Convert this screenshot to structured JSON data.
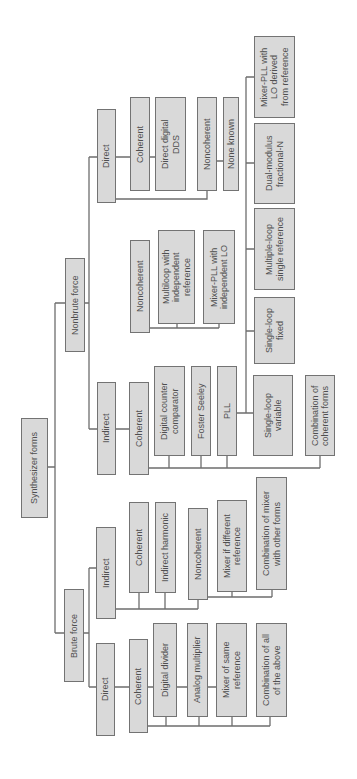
{
  "diagram": {
    "root": {
      "label": "Synthesizer forms"
    },
    "nonbrute_force": {
      "label": "Nonbrute force",
      "direct": {
        "label": "Direct",
        "coherent": {
          "label": "Coherent",
          "items": [
            "Direct digital\nDDS"
          ]
        },
        "noncoherent": {
          "label": "Noncoherent",
          "items": [
            "None known"
          ]
        }
      },
      "indirect": {
        "label": "Indirect",
        "noncoherent": {
          "label": "Noncoherent",
          "items": [
            "Multiloop with\nindependent\nreference",
            "Mixer-PLL with\nindependent LO"
          ]
        },
        "coherent": {
          "label": "Coherent",
          "items": [
            "Digital counter\ncomparator",
            "Foster Seeley",
            "PLL",
            "Combination of\ncoherent forms"
          ],
          "pll_types": [
            "Mixer-PLL with\nLO derived\nfrom reference",
            "Dual-modulus\nfractional-N",
            "Multiple-loop\nsingle reference",
            "Single-loop\nfixed",
            "Single-loop\nvariable"
          ]
        }
      }
    },
    "brute_force": {
      "label": "Brute force",
      "indirect": {
        "label": "Indirect",
        "coherent": {
          "label": "Coherent",
          "items": [
            "Indirect harmonic"
          ]
        },
        "noncoherent": {
          "label": "Noncoherent",
          "items": [
            "Mixer if different\nreference",
            "Combination of mixer\nwith other forms"
          ]
        }
      },
      "direct": {
        "label": "Direct",
        "coherent": {
          "label": "Coherent",
          "items": [
            "Digital divider",
            "Analog multiplier",
            "Mixer of same\nreference",
            "Combination of all\nof the above"
          ]
        }
      }
    }
  }
}
